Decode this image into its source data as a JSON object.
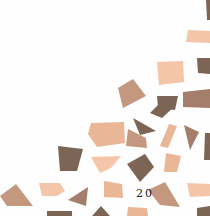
{
  "page": {
    "number": "20",
    "background": "#fefefe"
  },
  "mosaic": {
    "description": "decorative mosaic of skin-tone polygon tiles",
    "palette": {
      "peach": "#f4c5a8",
      "light_tan": "#e9b796",
      "tan": "#c4987e",
      "mid_brown": "#a47e6a",
      "dark_brown": "#7d6556"
    },
    "tiles": [
      {
        "points": "206,0 210,0 210,20 207,20",
        "fill": "#7d6556"
      },
      {
        "points": "188,30 210,31 210,43 186,42",
        "fill": "#f4c5a8"
      },
      {
        "points": "197,58 210,58 210,74 198,73",
        "fill": "#7d6556"
      },
      {
        "points": "157,62 183,61 184,82 159,85",
        "fill": "#f4c5a8"
      },
      {
        "points": "118,88 133,79 146,96 123,108",
        "fill": "#c4987e"
      },
      {
        "points": "157,96 178,96 175,110 158,108",
        "fill": "#7d6556"
      },
      {
        "points": "183,92 210,89 210,108 183,107",
        "fill": "#a47e6a"
      },
      {
        "points": "162,101 176,105 162,118 150,113",
        "fill": "#7d6556"
      },
      {
        "points": "91,123 124,122 125,143 97,147 88,134",
        "fill": "#e9b796"
      },
      {
        "points": "128,129 146,138 147,148 126,146",
        "fill": "#c4987e"
      },
      {
        "points": "133,118 156,131 140,135",
        "fill": "#7d6556"
      },
      {
        "points": "169,124 177,126 168,148 160,146",
        "fill": "#e9b796"
      },
      {
        "points": "184,125 199,132 190,150",
        "fill": "#a47e6a"
      },
      {
        "points": "205,133 210,133 210,160 204,160",
        "fill": "#7d6556"
      },
      {
        "points": "58,146 83,149 77,171 60,171",
        "fill": "#7d6556"
      },
      {
        "points": "91,157 121,156 111,168 100,173",
        "fill": "#f4c5a8"
      },
      {
        "points": "127,164 145,154 154,167 140,182",
        "fill": "#7d6556"
      },
      {
        "points": "166,153 181,156 177,172 164,172",
        "fill": "#e9b796"
      },
      {
        "points": "0,196 16,184 33,206 7,206",
        "fill": "#c4987e"
      },
      {
        "points": "39,183 60,183 65,191 57,196 42,196",
        "fill": "#f4c5a8"
      },
      {
        "points": "68,200 88,187 86,206",
        "fill": "#a47e6a"
      },
      {
        "points": "104,181 122,184 123,198 104,197",
        "fill": "#e9b796"
      },
      {
        "points": "148,190 165,182 180,207 160,205",
        "fill": "#c4987e"
      },
      {
        "points": "187,183 210,184 210,196 190,197",
        "fill": "#f4c5a8"
      },
      {
        "points": "47,211 72,211 72,216 47,216",
        "fill": "#7d6556"
      },
      {
        "points": "92,216 101,206 110,216",
        "fill": "#7d6556"
      },
      {
        "points": "128,207 147,208 148,216 127,216",
        "fill": "#e9b796"
      },
      {
        "points": "197,208 210,206 210,216 197,216",
        "fill": "#7d6556"
      }
    ]
  }
}
